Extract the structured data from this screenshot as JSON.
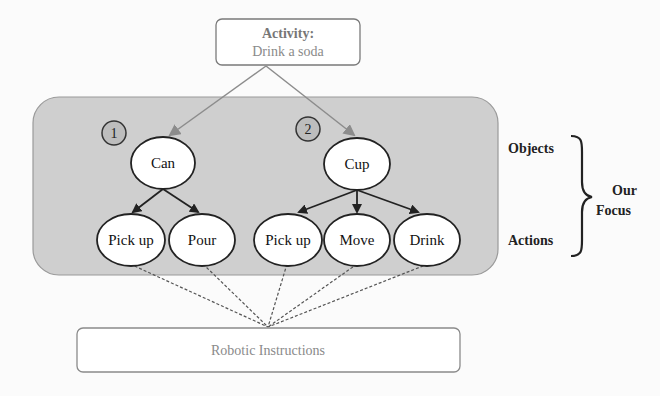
{
  "activity": {
    "title": "Activity:",
    "value": "Drink a soda"
  },
  "groups": [
    {
      "number": "1",
      "object": "Can",
      "actions": [
        "Pick up",
        "Pour"
      ]
    },
    {
      "number": "2",
      "object": "Cup",
      "actions": [
        "Pick up",
        "Move",
        "Drink"
      ]
    }
  ],
  "side_labels": {
    "objects": "Objects",
    "actions": "Actions",
    "focus_line1": "Our",
    "focus_line2": "Focus"
  },
  "output": {
    "label": "Robotic Instructions"
  },
  "colors": {
    "focus_region": "#cfcfcf",
    "node_fill": "#ffffff",
    "stroke": "#3a3a3a",
    "faded_text": "#8a8a8a",
    "arrow_gray": "#8c8c8c"
  }
}
